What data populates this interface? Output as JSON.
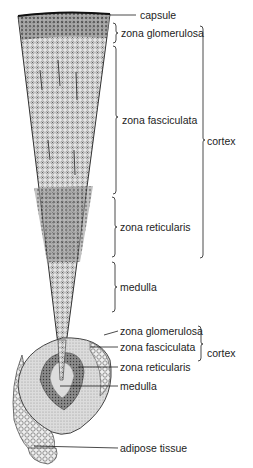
{
  "figure": {
    "colors": {
      "ink": "#1d1d1d",
      "background": "#ffffff",
      "tissue_dark": "#555555",
      "tissue_light": "#c8c8c8"
    }
  },
  "upper_section": {
    "labels": {
      "capsule": "capsule",
      "zona_glomerulosa": "zona glomerulosa",
      "zona_fasciculata": "zona fasciculata",
      "zona_reticularis": "zona reticularis",
      "medulla": "medulla",
      "cortex": "cortex"
    }
  },
  "lower_section": {
    "labels": {
      "zona_glomerulosa": "zona glomerulosa",
      "zona_fasciculata": "zona fasciculata",
      "zona_reticularis": "zona reticularis",
      "medulla": "medulla",
      "cortex": "cortex",
      "adipose_tissue": "adipose tissue"
    }
  }
}
